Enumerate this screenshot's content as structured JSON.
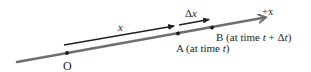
{
  "diagram": {
    "colors": {
      "axis": "#6d6e71",
      "vector": "#231f20",
      "text": "#231f20",
      "background": "#ffffff"
    },
    "axis": {
      "label": "+x",
      "start": [
        17,
        62
      ],
      "end": [
        267,
        17
      ]
    },
    "points": [
      {
        "id": "O",
        "label": "O",
        "pos": [
          67,
          53
        ]
      },
      {
        "id": "A",
        "label": "A (at time ",
        "var": "t",
        "suffix": ")",
        "pos": [
          178,
          34
        ]
      },
      {
        "id": "B",
        "label": "B (at time ",
        "var": "t",
        "plus": " + Δ",
        "var2": "t",
        "suffix": ")",
        "pos": [
          212,
          28
        ]
      }
    ],
    "vectors": [
      {
        "id": "x",
        "label": "x",
        "from": [
          64,
          45
        ],
        "to": [
          175,
          26
        ]
      },
      {
        "id": "delta-x",
        "label_prefix": "Δ",
        "label": "x",
        "from": [
          179,
          25
        ],
        "to": [
          210,
          19
        ]
      }
    ]
  }
}
